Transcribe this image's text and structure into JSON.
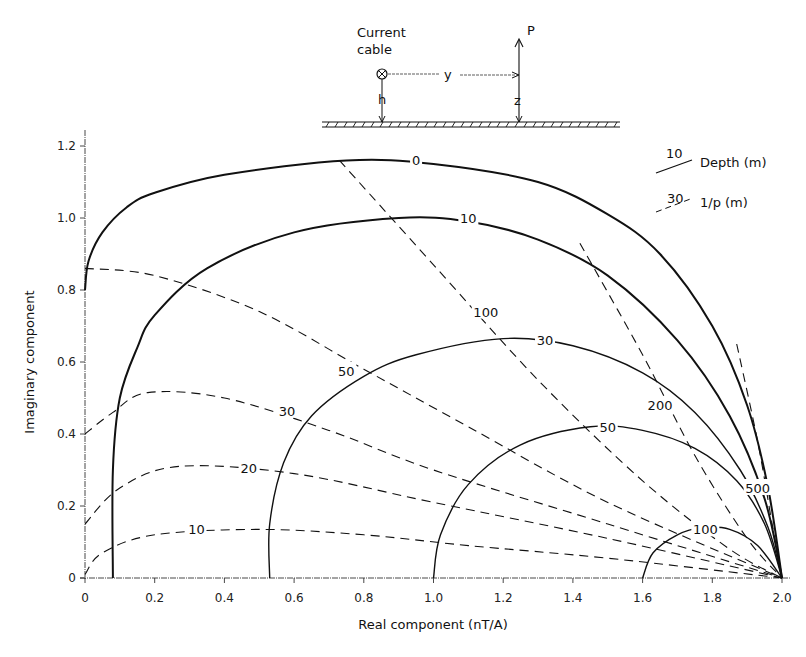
{
  "chart_data": {
    "type": "line",
    "title": "",
    "xlabel": "Real component (nT/A)",
    "ylabel": "Imaginary component",
    "xlim": [
      0,
      2.0
    ],
    "ylim": [
      0,
      1.2
    ],
    "xticks": [
      "0",
      "0.2",
      "0.4",
      "0.6",
      "0.8",
      "1.0",
      "1.2",
      "1.4",
      "1.6",
      "1.8",
      "2.0"
    ],
    "yticks": [
      "0",
      "0.2",
      "0.4",
      "0.6",
      "0.8",
      "1.0",
      "1.2"
    ],
    "grid": false,
    "legend": {
      "position": "top-right",
      "entries": [
        {
          "sample": "10",
          "style": "solid",
          "label": "Depth (m)"
        },
        {
          "sample": "30",
          "style": "dashed",
          "label": "1/p (m)"
        }
      ]
    },
    "inset": {
      "cable_label_1": "Current",
      "cable_label_2": "cable",
      "y_label": "y",
      "h_label": "h",
      "z_label": "z",
      "p_label": "P"
    },
    "series": [
      {
        "name": "Depth 0",
        "style": "solid",
        "label": "0",
        "points": [
          [
            0,
            0.8
          ],
          [
            0.01,
            0.88
          ],
          [
            0.05,
            0.96
          ],
          [
            0.12,
            1.03
          ],
          [
            0.2,
            1.07
          ],
          [
            0.4,
            1.12
          ],
          [
            0.75,
            1.16
          ],
          [
            1.0,
            1.15
          ],
          [
            1.3,
            1.1
          ],
          [
            1.5,
            1.01
          ],
          [
            1.65,
            0.9
          ],
          [
            1.8,
            0.7
          ],
          [
            1.9,
            0.48
          ],
          [
            1.96,
            0.25
          ],
          [
            2.0,
            0
          ]
        ]
      },
      {
        "name": "Depth 10",
        "style": "solid",
        "label": "10",
        "points": [
          [
            0.08,
            0
          ],
          [
            0.08,
            0.3
          ],
          [
            0.1,
            0.5
          ],
          [
            0.15,
            0.64
          ],
          [
            0.2,
            0.73
          ],
          [
            0.35,
            0.86
          ],
          [
            0.6,
            0.96
          ],
          [
            0.9,
            1.0
          ],
          [
            1.1,
            0.99
          ],
          [
            1.3,
            0.94
          ],
          [
            1.5,
            0.84
          ],
          [
            1.7,
            0.66
          ],
          [
            1.85,
            0.45
          ],
          [
            1.95,
            0.22
          ],
          [
            2.0,
            0
          ]
        ]
      },
      {
        "name": "Depth 30",
        "style": "solid",
        "label": "30",
        "points": [
          [
            0.53,
            0
          ],
          [
            0.53,
            0.15
          ],
          [
            0.57,
            0.32
          ],
          [
            0.65,
            0.45
          ],
          [
            0.8,
            0.56
          ],
          [
            0.95,
            0.62
          ],
          [
            1.2,
            0.665
          ],
          [
            1.4,
            0.645
          ],
          [
            1.6,
            0.57
          ],
          [
            1.75,
            0.46
          ],
          [
            1.88,
            0.3
          ],
          [
            1.96,
            0.14
          ],
          [
            2.0,
            0
          ]
        ]
      },
      {
        "name": "Depth 50",
        "style": "solid",
        "label": "50",
        "points": [
          [
            1.0,
            0
          ],
          [
            1.02,
            0.12
          ],
          [
            1.1,
            0.26
          ],
          [
            1.25,
            0.37
          ],
          [
            1.45,
            0.42
          ],
          [
            1.6,
            0.41
          ],
          [
            1.75,
            0.36
          ],
          [
            1.87,
            0.27
          ],
          [
            1.95,
            0.15
          ],
          [
            2.0,
            0
          ]
        ]
      },
      {
        "name": "Depth 100",
        "style": "solid",
        "label": "100",
        "points": [
          [
            1.6,
            0
          ],
          [
            1.63,
            0.07
          ],
          [
            1.7,
            0.12
          ],
          [
            1.77,
            0.14
          ],
          [
            1.85,
            0.135
          ],
          [
            1.93,
            0.09
          ],
          [
            2.0,
            0
          ]
        ]
      },
      {
        "name": "1/p 10",
        "style": "dashed",
        "label": "10",
        "points": [
          [
            0,
            0.01
          ],
          [
            0.05,
            0.07
          ],
          [
            0.2,
            0.12
          ],
          [
            0.5,
            0.135
          ],
          [
            0.8,
            0.12
          ],
          [
            1.1,
            0.09
          ],
          [
            1.5,
            0.055
          ],
          [
            2.0,
            0
          ]
        ]
      },
      {
        "name": "1/p 20",
        "style": "dashed",
        "label": "20",
        "points": [
          [
            0,
            0.15
          ],
          [
            0.1,
            0.25
          ],
          [
            0.27,
            0.31
          ],
          [
            0.6,
            0.29
          ],
          [
            1.0,
            0.21
          ],
          [
            1.5,
            0.11
          ],
          [
            2.0,
            0
          ]
        ]
      },
      {
        "name": "1/p 30",
        "style": "dashed",
        "label": "30",
        "points": [
          [
            0,
            0.4
          ],
          [
            0.08,
            0.46
          ],
          [
            0.18,
            0.515
          ],
          [
            0.4,
            0.5
          ],
          [
            0.7,
            0.41
          ],
          [
            1.0,
            0.3
          ],
          [
            1.5,
            0.15
          ],
          [
            2.0,
            0
          ]
        ]
      },
      {
        "name": "1/p 50",
        "style": "dashed",
        "label": "50",
        "points": [
          [
            0,
            0.86
          ],
          [
            0.2,
            0.84
          ],
          [
            0.5,
            0.74
          ],
          [
            0.8,
            0.58
          ],
          [
            1.1,
            0.42
          ],
          [
            1.5,
            0.21
          ],
          [
            2.0,
            0
          ]
        ]
      },
      {
        "name": "1/p 100",
        "style": "dashed",
        "label": "100",
        "points": [
          [
            0.73,
            1.16
          ],
          [
            1.0,
            0.87
          ],
          [
            1.3,
            0.55
          ],
          [
            1.6,
            0.27
          ],
          [
            1.85,
            0.08
          ],
          [
            2.0,
            0
          ]
        ]
      },
      {
        "name": "1/p 200",
        "style": "dashed",
        "label": "200",
        "points": [
          [
            1.42,
            0.93
          ],
          [
            1.6,
            0.62
          ],
          [
            1.75,
            0.34
          ],
          [
            1.9,
            0.11
          ],
          [
            2.0,
            0
          ]
        ]
      },
      {
        "name": "1/p 500",
        "style": "dashed",
        "label": "500",
        "points": [
          [
            1.87,
            0.65
          ],
          [
            1.93,
            0.38
          ],
          [
            1.97,
            0.16
          ],
          [
            2.0,
            0
          ]
        ]
      }
    ],
    "curve_labels": [
      {
        "text": "0",
        "x": 0.95,
        "y": 1.16
      },
      {
        "text": "10",
        "x": 1.1,
        "y": 1.0
      },
      {
        "text": "30",
        "x": 1.32,
        "y": 0.66
      },
      {
        "text": "50",
        "x": 1.5,
        "y": 0.42
      },
      {
        "text": "100",
        "x": 1.78,
        "y": 0.135
      },
      {
        "text": "10",
        "x": 0.32,
        "y": 0.135
      },
      {
        "text": "20",
        "x": 0.47,
        "y": 0.305
      },
      {
        "text": "30",
        "x": 0.58,
        "y": 0.465
      },
      {
        "text": "50",
        "x": 0.75,
        "y": 0.575
      },
      {
        "text": "100",
        "x": 1.15,
        "y": 0.74
      },
      {
        "text": "200",
        "x": 1.65,
        "y": 0.48
      },
      {
        "text": "500",
        "x": 1.93,
        "y": 0.25
      }
    ]
  }
}
